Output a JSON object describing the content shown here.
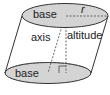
{
  "diagram": {
    "labels": {
      "top_base": "base",
      "bottom_base": "base",
      "axis": "axis",
      "altitude": "altitude",
      "radius": "r"
    },
    "colors": {
      "base_fill": "#d4d4d4",
      "stroke": "#333333",
      "background": "#ffffff"
    }
  }
}
